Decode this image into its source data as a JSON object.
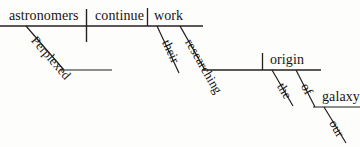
{
  "diagram": {
    "type": "reed-kellogg-sentence-diagram",
    "sentence": "Perplexed astronomers continue work researching their origin of the galaxy our",
    "ink_color": "#231f1e",
    "background_color": "#fdfdfb",
    "words": {
      "subject": "astronomers",
      "verb": "continue",
      "object": "work",
      "subject_modifier": "Perplexed",
      "participle": "researching",
      "participle_modifier": "their",
      "participle_object": "origin",
      "object_modifier_the": "the",
      "preposition": "of",
      "prep_object": "galaxy",
      "prep_object_modifier": "our"
    }
  }
}
